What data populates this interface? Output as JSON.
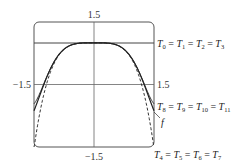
{
  "chart_data": {
    "type": "line",
    "title": "",
    "xlabel": "",
    "ylabel": "",
    "xlim": [
      -1.5,
      1.5
    ],
    "ylim": [
      -1.5,
      1.5
    ],
    "grid": false,
    "tick_labels": {
      "top": "1.5",
      "bottom": "-1.5",
      "left": "−1.5",
      "right": "1.5",
      "bottom_display": "−1.5"
    },
    "series": [
      {
        "name": "f",
        "function": "cos(x^2)",
        "style": "solid"
      },
      {
        "name": "T0 = T1 = T2 = T3",
        "function": "1",
        "style": "solid"
      },
      {
        "name": "T4 = T5 = T6 = T7",
        "function": "1 - x^4/2",
        "style": "dashed"
      },
      {
        "name": "T8 = T9 = T10 = T11",
        "function": "1 - x^4/2 + x^8/24",
        "style": "solid"
      }
    ],
    "annotations": [
      {
        "text": "T0 = T1 = T2 = T3",
        "target": "horizontal line y=1"
      },
      {
        "text": "T8 = T9 = T10 = T11",
        "target": "solid curve near right edge"
      },
      {
        "text": "f",
        "target": "f curve"
      },
      {
        "text": "T4 = T5 = T6 = T7",
        "target": "dashed curve at bottom right"
      }
    ]
  },
  "labels": {
    "top_tick": "1.5",
    "bottom_tick": "−1.5",
    "left_tick": "−1.5",
    "right_tick": "1.5",
    "f_label": "f",
    "t0": {
      "T": "T",
      "subs": [
        "0",
        "1",
        "2",
        "3"
      ]
    },
    "t8": {
      "T": "T",
      "subs": [
        "8",
        "9",
        "10",
        "11"
      ]
    },
    "t4": {
      "T": "T",
      "subs": [
        "4",
        "5",
        "6",
        "7"
      ]
    }
  }
}
